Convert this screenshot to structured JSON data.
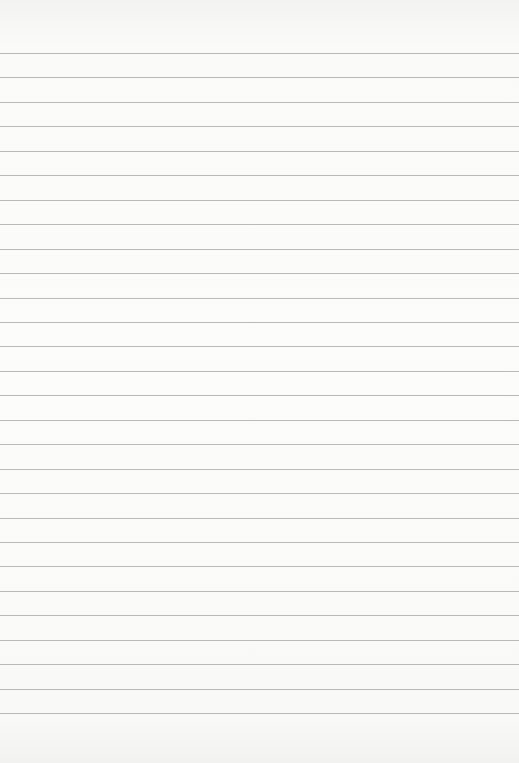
{
  "paper": {
    "type": "lined notebook paper",
    "background_color": "#fbfbfa",
    "line_color": "#b9b9b9",
    "line_count": 28,
    "first_line_y": 53,
    "line_spacing": 24.45,
    "text": ""
  }
}
